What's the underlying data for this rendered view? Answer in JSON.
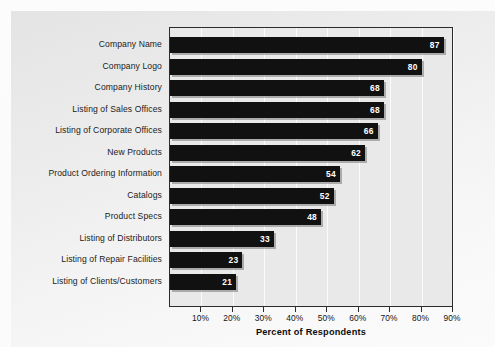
{
  "chart_data": {
    "type": "bar",
    "orientation": "horizontal",
    "title": "",
    "xlabel": "Percent of Respondents",
    "ylabel": "",
    "xlim": [
      0,
      90
    ],
    "grid": true,
    "legend": false,
    "xticks": [
      "10%",
      "20%",
      "30%",
      "40%",
      "50%",
      "60%",
      "70%",
      "80%",
      "90%"
    ],
    "xtick_values": [
      10,
      20,
      30,
      40,
      50,
      60,
      70,
      80,
      90
    ],
    "categories": [
      "Company Name",
      "Company Logo",
      "Company History",
      "Listing of Sales Offices",
      "Listing of Corporate Offices",
      "New Products",
      "Product Ordering Information",
      "Catalogs",
      "Product Specs",
      "Listing of Distributors",
      "Listing of Repair Facilities",
      "Listing of Clients/Customers"
    ],
    "values": [
      87,
      80,
      68,
      68,
      66,
      62,
      54,
      52,
      48,
      33,
      23,
      21
    ],
    "value_labels": [
      "87",
      "80",
      "68",
      "68",
      "66",
      "62",
      "54",
      "52",
      "48",
      "33",
      "23",
      "21"
    ],
    "colors": {
      "bar": "#111111",
      "plot_background": "#e9e9e9",
      "gridline": "#fbfbfb",
      "axis": "#2b2b2b",
      "value_label": "#ffffff",
      "page_background": "#ededed"
    }
  }
}
